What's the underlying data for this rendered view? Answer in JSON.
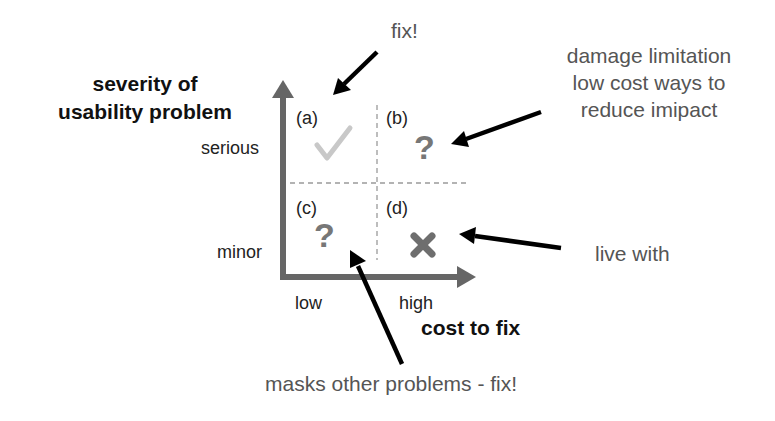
{
  "axes": {
    "y_title_line1": "severity of",
    "y_title_line2": "usability problem",
    "y_tick_high": "serious",
    "y_tick_low": "minor",
    "x_title": "cost to fix",
    "x_tick_low": "low",
    "x_tick_high": "high"
  },
  "quadrants": [
    {
      "id": "a",
      "label": "(a)",
      "symbol": "check-mark",
      "symbol_color": "#c8c8c8"
    },
    {
      "id": "b",
      "label": "(b)",
      "symbol": "question-mark",
      "glyph": "?",
      "symbol_color": "#777777"
    },
    {
      "id": "c",
      "label": "(c)",
      "symbol": "question-mark",
      "glyph": "?",
      "symbol_color": "#777777"
    },
    {
      "id": "d",
      "label": "(d)",
      "symbol": "cross-mark",
      "symbol_color": "#6e6e6e"
    }
  ],
  "annotations": {
    "a": "fix!",
    "b_line1": "damage limitation",
    "b_line2": "low cost ways to",
    "b_line3": "reduce imipact",
    "c": "masks other problems - fix!",
    "d": "live with"
  },
  "colors": {
    "axis": "#666666",
    "dashed": "#9a9a9a",
    "arrow": "#000000",
    "note_text": "#555555"
  }
}
